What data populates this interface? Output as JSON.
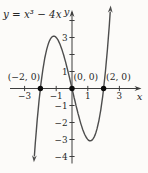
{
  "figure": {
    "equation_label": "y = x³ − 4x",
    "x_axis_label": "x",
    "y_axis_label": "y",
    "background": "#fcfbf9",
    "curve_color": "#4d4d4d",
    "axis_color": "#3d3d3d",
    "text_color": "#262626",
    "point_color": "#0a0a0a"
  },
  "chart_data": {
    "type": "line",
    "title": "y = x³ − 4x",
    "function": "y = x^3 - 4x",
    "polynomial_coeffs": [
      0,
      -4,
      0,
      1
    ],
    "x_plot_range": [
      -2.38,
      2.42
    ],
    "x_axis_range": [
      -3.9,
      4.4
    ],
    "y_axis_range": [
      -4.6,
      4.6
    ],
    "xlabel": "x",
    "ylabel": "y",
    "grid": false,
    "legend": false,
    "x_ticks": [
      {
        "value": -3,
        "label": "−3"
      },
      {
        "value": -2,
        "label": ""
      },
      {
        "value": -1,
        "label": "−1"
      },
      {
        "value": 1,
        "label": "1"
      },
      {
        "value": 2,
        "label": ""
      },
      {
        "value": 3,
        "label": "3"
      }
    ],
    "y_ticks": [
      {
        "value": 4,
        "label": ""
      },
      {
        "value": 3,
        "label": "3"
      },
      {
        "value": 2,
        "label": ""
      },
      {
        "value": 1,
        "label": "1"
      },
      {
        "value": -1,
        "label": "−1"
      },
      {
        "value": -2,
        "label": "−2"
      },
      {
        "value": -3,
        "label": "−3"
      },
      {
        "value": -4,
        "label": "−4"
      }
    ],
    "x_intercepts": [
      -2,
      0,
      2
    ],
    "labeled_points": [
      {
        "x": -2,
        "y": 0,
        "label": "(−2, 0)"
      },
      {
        "x": 0,
        "y": 0,
        "label": "(0, 0)"
      },
      {
        "x": 2,
        "y": 0,
        "label": "(2, 0)"
      }
    ],
    "key_points": [
      {
        "x": -2,
        "y": 0
      },
      {
        "x": -1,
        "y": 3
      },
      {
        "x": 0,
        "y": 0
      },
      {
        "x": 1,
        "y": -3
      },
      {
        "x": 2,
        "y": 0
      }
    ],
    "local_max": {
      "x": -1.15,
      "y": 3.08
    },
    "local_min": {
      "x": 1.15,
      "y": -3.08
    }
  }
}
